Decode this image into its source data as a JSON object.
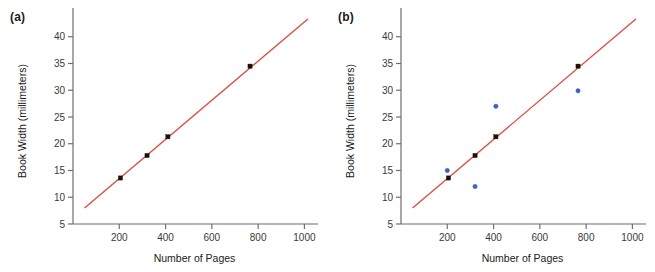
{
  "figure": {
    "panels": [
      {
        "id": "a",
        "label": "(a)",
        "label_name": "panel-a-label"
      },
      {
        "id": "b",
        "label": "(b)",
        "label_name": "panel-b-label"
      }
    ]
  },
  "chart_data": [
    {
      "type": "scatter",
      "panel": "a",
      "title": "",
      "xlabel": "Number of Pages",
      "ylabel": "Book Width (millimeters)",
      "xlim": [
        0,
        1050
      ],
      "ylim": [
        5,
        43.5
      ],
      "xticks": [
        200,
        400,
        600,
        800,
        1000
      ],
      "yticks": [
        5,
        10,
        15,
        20,
        25,
        30,
        35,
        40
      ],
      "xtick_labels": [
        "200",
        "400",
        "600",
        "800",
        "1000"
      ],
      "ytick_labels": [
        "5",
        "10",
        "15",
        "20",
        "25",
        "30",
        "35",
        "40"
      ],
      "grid": false,
      "legend": "none",
      "series": [
        {
          "name": "observed",
          "marker": "square",
          "color": "#1c1009",
          "points": [
            {
              "x": 205,
              "y": 13.6
            },
            {
              "x": 320,
              "y": 17.8
            },
            {
              "x": 410,
              "y": 21.3
            },
            {
              "x": 765,
              "y": 34.5
            }
          ]
        },
        {
          "name": "regression line",
          "type": "line",
          "color": "#e8453c",
          "points": [
            {
              "x": 50,
              "y": 8.0
            },
            {
              "x": 1015,
              "y": 43.3
            }
          ]
        }
      ]
    },
    {
      "type": "scatter",
      "panel": "b",
      "title": "",
      "xlabel": "Number of Pages",
      "ylabel": "Book Width (millimeters)",
      "xlim": [
        0,
        1050
      ],
      "ylim": [
        5,
        43.5
      ],
      "xticks": [
        200,
        400,
        600,
        800,
        1000
      ],
      "yticks": [
        5,
        10,
        15,
        20,
        25,
        30,
        35,
        40
      ],
      "xtick_labels": [
        "200",
        "400",
        "600",
        "800",
        "1000"
      ],
      "ytick_labels": [
        "5",
        "10",
        "15",
        "20",
        "25",
        "30",
        "35",
        "40"
      ],
      "grid": false,
      "legend": "none",
      "series": [
        {
          "name": "observed",
          "marker": "square",
          "color": "#1c1009",
          "points": [
            {
              "x": 205,
              "y": 13.6
            },
            {
              "x": 320,
              "y": 17.8
            },
            {
              "x": 410,
              "y": 21.3
            },
            {
              "x": 765,
              "y": 34.5
            }
          ]
        },
        {
          "name": "predicted",
          "marker": "circle",
          "color": "#3b62c4",
          "points": [
            {
              "x": 200,
              "y": 15.0
            },
            {
              "x": 320,
              "y": 12.0
            },
            {
              "x": 410,
              "y": 27.0
            },
            {
              "x": 765,
              "y": 29.9
            }
          ]
        },
        {
          "name": "regression line",
          "type": "line",
          "color": "#e8453c",
          "points": [
            {
              "x": 50,
              "y": 8.0
            },
            {
              "x": 1015,
              "y": 43.3
            }
          ]
        }
      ]
    }
  ],
  "colors": {
    "line": "#e8453c",
    "observed": "#1c1009",
    "predicted": "#3b62c4",
    "axis": "#6e6e6e",
    "text": "#1a1a1a",
    "background": "#ffffff"
  }
}
